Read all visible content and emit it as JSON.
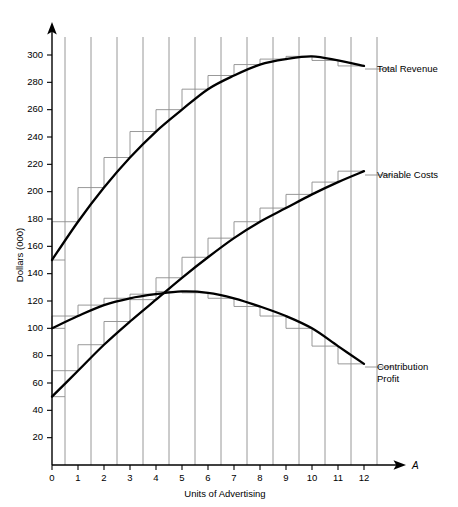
{
  "chart_data": {
    "type": "line",
    "title": "",
    "subtitle": "",
    "xlabel": "Units of Advertising",
    "ylabel": "Dollars (000)",
    "x_axis_variable": "A",
    "xlim": [
      0,
      12.5
    ],
    "ylim": [
      0,
      310
    ],
    "x_ticks": [
      0,
      1,
      2,
      3,
      4,
      5,
      6,
      7,
      8,
      9,
      10,
      11,
      12
    ],
    "x_tick_labels": [
      "0",
      "1",
      "2",
      "3",
      "4",
      "5",
      "6",
      "7",
      "8",
      "9",
      "10",
      "11",
      "12"
    ],
    "y_ticks": [
      20,
      40,
      60,
      80,
      100,
      120,
      140,
      160,
      180,
      200,
      220,
      240,
      260,
      280,
      300
    ],
    "y_tick_labels": [
      "20",
      "40",
      "60",
      "80",
      "100",
      "120",
      "140",
      "160",
      "180",
      "200",
      "220",
      "240",
      "260",
      "280",
      "300"
    ],
    "grid": "vertical-only-at-half-units",
    "gridline_x_positions": [
      0.5,
      1.5,
      2.5,
      3.5,
      4.5,
      5.5,
      6.5,
      7.5,
      8.5,
      9.5,
      10.5,
      11.5,
      12.5
    ],
    "legend_position": "right-of-curve-ends",
    "x": [
      0,
      1,
      2,
      3,
      4,
      5,
      6,
      7,
      8,
      9,
      10,
      11,
      12
    ],
    "series": [
      {
        "name": "Total Revenue",
        "label": "Total Revenue",
        "color": "#000000",
        "values": [
          150,
          178,
          203,
          225,
          244,
          260,
          275,
          285,
          293,
          297,
          299,
          296,
          292
        ],
        "step_values": [
          150,
          178,
          203,
          225,
          244,
          260,
          275,
          285,
          293,
          297,
          299,
          296,
          292
        ],
        "label_anchor_x": 12.5,
        "label_anchor_y": 292
      },
      {
        "name": "Variable Costs",
        "label": "Variable Costs",
        "color": "#000000",
        "values": [
          50,
          69,
          88,
          105,
          121,
          137,
          152,
          166,
          178,
          188,
          198,
          207,
          215
        ],
        "step_values": [
          50,
          69,
          88,
          105,
          121,
          137,
          152,
          166,
          178,
          188,
          198,
          207,
          215
        ],
        "label_anchor_x": 12.5,
        "label_anchor_y": 215
      },
      {
        "name": "Contribution Profit",
        "label_line1": "Contribution",
        "label_line2": "Profit",
        "label": "Contribution Profit",
        "color": "#000000",
        "values": [
          100,
          109,
          117,
          122,
          125,
          127,
          126,
          122,
          116,
          109,
          100,
          87,
          74
        ],
        "step_values": [
          100,
          109,
          117,
          122,
          125,
          127,
          126,
          122,
          116,
          109,
          100,
          87,
          74
        ],
        "label_anchor_x": 12.5,
        "label_anchor_y": 74
      }
    ],
    "notes": {
      "total_revenue_peak_x": 10,
      "total_revenue_peak_y": 299,
      "contribution_profit_peak_x": 5,
      "contribution_profit_peak_y": 127,
      "crossover_variable_costs_and_profit_x": 4.5
    }
  }
}
